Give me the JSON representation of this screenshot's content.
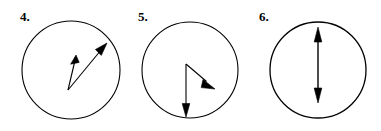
{
  "page": {
    "background_color": "#ffffff",
    "stroke_color": "#000000",
    "width": 381,
    "height": 131
  },
  "figures": [
    {
      "label": "4.",
      "name": "figure-4",
      "circle": {
        "cx": 71,
        "cy": 70,
        "r": 49,
        "stroke_width": 1.1
      },
      "description": "Two vectors from a common origin inside the circle, both pointing up and to the right at different angles",
      "vectors": [
        {
          "name": "vector-4-short",
          "from": {
            "x": 68,
            "y": 90
          },
          "to": {
            "x": 76,
            "y": 56
          },
          "direction": "up-right-steep",
          "head_length": 11,
          "head_width": 6
        },
        {
          "name": "vector-4-long",
          "from": {
            "x": 68,
            "y": 90
          },
          "to": {
            "x": 107,
            "y": 43
          },
          "direction": "up-right-shallow",
          "head_length": 13,
          "head_width": 6
        }
      ]
    },
    {
      "label": "5.",
      "name": "figure-5",
      "circle": {
        "cx": 190,
        "cy": 70,
        "r": 48,
        "stroke_width": 1.1
      },
      "description": "Two vectors from a common origin above center, one pointing down-right and one pointing straight down",
      "vectors": [
        {
          "name": "vector-5-diagonal",
          "from": {
            "x": 186,
            "y": 64
          },
          "to": {
            "x": 215,
            "y": 89
          },
          "direction": "down-right",
          "head_length": 13,
          "head_width": 6
        },
        {
          "name": "vector-5-vertical",
          "from": {
            "x": 186,
            "y": 64
          },
          "to": {
            "x": 186,
            "y": 116
          },
          "direction": "down",
          "head_length": 12,
          "head_width": 6
        }
      ]
    },
    {
      "label": "6.",
      "name": "figure-6",
      "circle": {
        "cx": 318,
        "cy": 70,
        "r": 48,
        "stroke_width": 1.3
      },
      "description": "A single vertical double-headed arrow through the circle centre",
      "vectors": [
        {
          "name": "vector-6-double-headed",
          "from": {
            "x": 318,
            "y": 102
          },
          "to": {
            "x": 318,
            "y": 28
          },
          "direction": "vertical-both",
          "double_headed": true,
          "head_length": 14,
          "head_width": 7
        }
      ]
    }
  ]
}
